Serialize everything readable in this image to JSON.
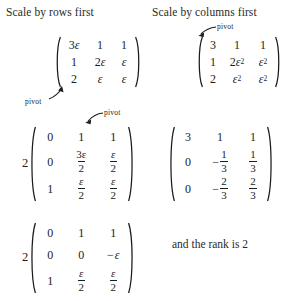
{
  "headings": {
    "left": "Scale by rows first",
    "right": "Scale by columns first"
  },
  "labels": {
    "pivot": "pivot",
    "rank_note": "and the rank is 2"
  },
  "symbols": {
    "epsilon": "ε",
    "minus": "−"
  },
  "matrices": {
    "left_1": {
      "coefficient": "",
      "rows": [
        [
          "3ε",
          "1",
          "1"
        ],
        [
          "1",
          "2ε",
          "ε"
        ],
        [
          "2",
          "ε",
          "ε"
        ]
      ]
    },
    "left_2": {
      "coefficient": "2",
      "rows": [
        [
          "0",
          "1",
          "1"
        ],
        [
          "0",
          "3ε/2",
          "ε/2"
        ],
        [
          "1",
          "ε/2",
          "ε/2"
        ]
      ]
    },
    "left_3": {
      "coefficient": "2",
      "rows": [
        [
          "0",
          "1",
          "1"
        ],
        [
          "0",
          "0",
          "−ε"
        ],
        [
          "1",
          "ε/2",
          "ε/2"
        ]
      ]
    },
    "right_1": {
      "coefficient": "",
      "rows": [
        [
          "3",
          "1",
          "1"
        ],
        [
          "1",
          "2ε²",
          "ε²"
        ],
        [
          "2",
          "ε²",
          "ε²"
        ]
      ]
    },
    "right_2": {
      "coefficient": "",
      "rows": [
        [
          "3",
          "1",
          "1"
        ],
        [
          "0",
          "−1/3",
          "1/3"
        ],
        [
          "0",
          "−2/3",
          "2/3"
        ]
      ]
    }
  },
  "cells": {
    "m1": {
      "r0c0_a": "3",
      "r0c1": "1",
      "r0c2": "1",
      "r1c0": "1",
      "r1c1_a": "2",
      "r2c0": "2"
    },
    "m2": {
      "coef": "2",
      "r0c0": "0",
      "r0c1": "1",
      "r0c2": "1",
      "r1c0": "0",
      "r1c1_num": "3ε",
      "r1c1_den": "2",
      "r1c2_den": "2",
      "r2c0": "1",
      "r2c1_den": "2",
      "r2c2_den": "2"
    },
    "m3": {
      "coef": "2",
      "r0c0": "0",
      "r0c1": "1",
      "r0c2": "1",
      "r1c0": "0",
      "r1c1": "0",
      "r1c2_sign": "−",
      "r2c0": "1",
      "r2c1_den": "2",
      "r2c2_den": "2"
    },
    "m4": {
      "r0c0": "3",
      "r0c1": "1",
      "r0c2": "1",
      "r1c0": "1",
      "r1c1_a": "2",
      "r1c1_sup": "2",
      "r1c2_sup": "2",
      "r2c0": "2",
      "r2c1_sup": "2",
      "r2c2_sup": "2"
    },
    "m5": {
      "r0c0": "3",
      "r0c1": "1",
      "r0c2": "1",
      "r1c0": "0",
      "r1c1_sign": "−",
      "r1c1_num": "1",
      "r1c1_den": "3",
      "r1c2_num": "1",
      "r1c2_den": "3",
      "r2c0": "0",
      "r2c1_sign": "−",
      "r2c1_num": "2",
      "r2c1_den": "3",
      "r2c2_num": "2",
      "r2c2_den": "3"
    }
  }
}
